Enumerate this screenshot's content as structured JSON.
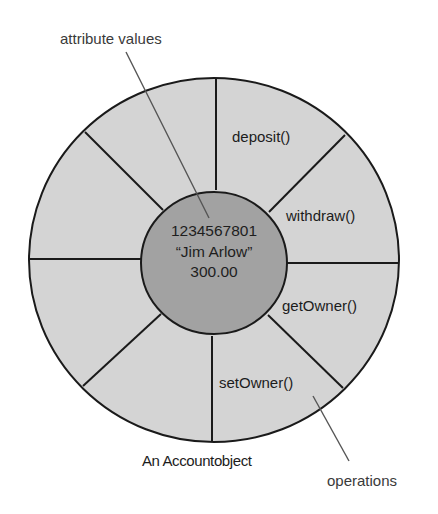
{
  "diagram": {
    "callouts": {
      "attributes": "attribute values",
      "operations": "operations"
    },
    "caption": "An Accountobject",
    "attribute_values": [
      "1234567801",
      "“Jim Arlow”",
      "300.00"
    ],
    "operations": [
      "deposit()",
      "withdraw()",
      "getOwner()",
      "setOwner()"
    ],
    "segments": 8,
    "colors": {
      "outer_ring_fill": "#d4d4d4",
      "inner_core_fill": "#a2a2a2",
      "stroke": "#1a1a1a",
      "leader_line": "#555555",
      "background": "#ffffff"
    }
  }
}
